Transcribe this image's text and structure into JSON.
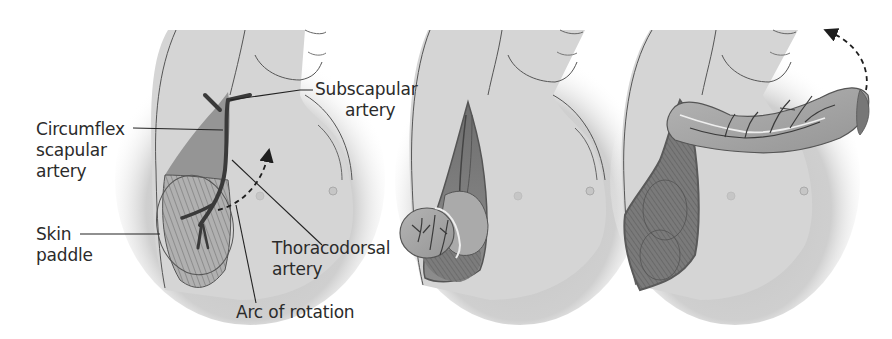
{
  "figure": {
    "panels": [
      {
        "id": "panel-1",
        "description": "Flap design with vascular pedicle and skin paddle outlined"
      },
      {
        "id": "panel-2",
        "description": "Flap raised and folded from the lateral chest wall"
      },
      {
        "id": "panel-3",
        "description": "Flap rotated anteriorly toward neck along arc of rotation"
      }
    ],
    "labels": {
      "circumflex": [
        "Circumflex",
        "scapular",
        "artery"
      ],
      "subscapular": [
        "Subscapular",
        "artery"
      ],
      "skin_paddle": [
        "Skin",
        "paddle"
      ],
      "thoracodorsal": [
        "Thoracodorsal",
        "artery"
      ],
      "arc": "Arc of rotation"
    },
    "colors": {
      "skin": "#d6d6d6",
      "skin_shadow": "#bdbdbd",
      "outline": "#4a4a4a",
      "muscle": "#8a8a8a",
      "muscle_dark": "#5e5e5e",
      "flap": "#a9a9a9",
      "vessel": "#3a3a3a",
      "leader": "#222222",
      "text": "#2b2b2b"
    }
  }
}
